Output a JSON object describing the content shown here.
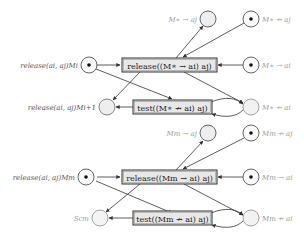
{
  "diagram": {
    "type": "petri-net",
    "blocks": [
      {
        "id": "top",
        "places": {
          "p_m_to_aj": {
            "label": "M∗ → aj",
            "token": false
          },
          "p_m_nto_aj": {
            "label": "M∗ ↛ aj",
            "token": true
          },
          "p_release_mi": {
            "label": "release(ai, aj)Mi",
            "token": true
          },
          "p_m_to_ai": {
            "label": "M∗ → ai",
            "token": true
          },
          "p_release_mi1": {
            "label": "release(ai, aj)Mi+1",
            "token": false
          },
          "p_m_nto_ai": {
            "label": "M∗ ↛ ai",
            "token": false
          }
        },
        "transitions": {
          "t_release": {
            "label": "release((M∗ → ai) aj)"
          },
          "t_test": {
            "label": "test((M∗ ↛ ai) aj)"
          }
        }
      },
      {
        "id": "bottom",
        "places": {
          "p_m_to_aj": {
            "label": "Mm → aj",
            "token": false
          },
          "p_m_nto_aj": {
            "label": "Mm ↛ aj",
            "token": true
          },
          "p_release_mi": {
            "label": "release(ai, aj)Mm",
            "token": true
          },
          "p_m_to_ai": {
            "label": "Mm → ai",
            "token": true
          },
          "p_scm": {
            "label": "Scm",
            "token": false
          },
          "p_m_nto_ai": {
            "label": "Mm ↛ ai",
            "token": false
          }
        },
        "transitions": {
          "t_release": {
            "label": "release((Mm → ai) aj)"
          },
          "t_test": {
            "label": "test((Mm ↛ ai) aj)"
          }
        }
      }
    ]
  }
}
